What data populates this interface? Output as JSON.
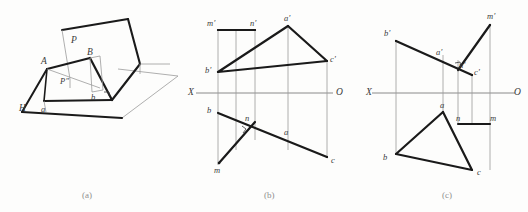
{
  "figure": {
    "caption_a": "(a)",
    "caption_b": "(b)",
    "caption_c": "(c)",
    "bottom_caption": "",
    "line_color_heavy": "#1a1a1a",
    "line_color_thin": "#8a8a8a",
    "axis_color": "#8a8a8a",
    "label_color": "#3a3a3a"
  },
  "panel_a": {
    "title": "(a)",
    "labels": [
      {
        "id": "P-plane",
        "text": "P",
        "x": 73,
        "y": 41
      },
      {
        "id": "point-A",
        "text": "A",
        "x": 44,
        "y": 62
      },
      {
        "id": "point-B",
        "text": "B",
        "x": 89,
        "y": 53
      },
      {
        "id": "point-P-dblprime",
        "text": "P″",
        "x": 63,
        "y": 82
      },
      {
        "id": "point-b",
        "text": "b",
        "x": 92,
        "y": 96
      },
      {
        "id": "point-a",
        "text": "a",
        "x": 42,
        "y": 111
      },
      {
        "id": "H-plane",
        "text": "H",
        "x": 21,
        "y": 109
      }
    ]
  },
  "panel_b": {
    "title": "(b)",
    "axis": {
      "left_label": "X",
      "right_label": "O"
    },
    "labels": [
      {
        "id": "m-prime",
        "text": "m′",
        "x": 210,
        "y": 24
      },
      {
        "id": "n-prime",
        "text": "n′",
        "x": 254,
        "y": 24
      },
      {
        "id": "a-prime",
        "text": "a′",
        "x": 281,
        "y": 20
      },
      {
        "id": "b-prime",
        "text": "b′",
        "x": 206,
        "y": 67
      },
      {
        "id": "c-prime",
        "text": "c′",
        "x": 320,
        "y": 64
      },
      {
        "id": "point-b",
        "text": "b",
        "x": 206,
        "y": 112
      },
      {
        "id": "point-n",
        "text": "n",
        "x": 242,
        "y": 118
      },
      {
        "id": "point-a",
        "text": "a",
        "x": 281,
        "y": 131
      },
      {
        "id": "point-m",
        "text": "m",
        "x": 216,
        "y": 170
      },
      {
        "id": "point-c",
        "text": "c",
        "x": 322,
        "y": 161
      }
    ]
  },
  "panel_c": {
    "title": "(c)",
    "axis": {
      "left_label": "X",
      "right_label": "O"
    },
    "labels": [
      {
        "id": "m-prime",
        "text": "m′",
        "x": 489,
        "y": 17
      },
      {
        "id": "b-prime",
        "text": "b′",
        "x": 386,
        "y": 33
      },
      {
        "id": "a-prime",
        "text": "a′",
        "x": 440,
        "y": 53
      },
      {
        "id": "n-prime",
        "text": "n′",
        "x": 461,
        "y": 63
      },
      {
        "id": "c-prime",
        "text": "c′",
        "x": 474,
        "y": 71
      },
      {
        "id": "point-a",
        "text": "a",
        "x": 443,
        "y": 111
      },
      {
        "id": "point-n",
        "text": "n",
        "x": 460,
        "y": 122
      },
      {
        "id": "point-m",
        "text": "m",
        "x": 492,
        "y": 122
      },
      {
        "id": "point-b",
        "text": "b",
        "x": 385,
        "y": 155
      },
      {
        "id": "point-c",
        "text": "c",
        "x": 478,
        "y": 170
      }
    ]
  },
  "geometry_a": {
    "plane_H_outline": "22,110 120,68 177,76 112,117",
    "plane_P_outline": "60,28 128,18 140,63 74,75",
    "triangle_ABb_a": "47,68 85,59 99,92 57,101"
  }
}
